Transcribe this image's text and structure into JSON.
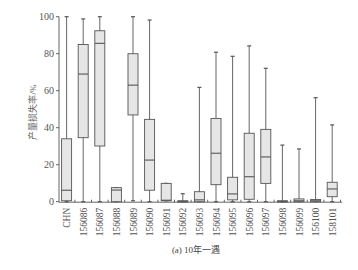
{
  "chart_data": {
    "type": "boxplot",
    "title": "(a) 10年一遇",
    "xlabel": "",
    "ylabel": "产量损失率/%",
    "ylim": [
      0,
      100
    ],
    "yticks": [
      0,
      20,
      40,
      60,
      80,
      100
    ],
    "grid": false,
    "legend": null,
    "categories": [
      "CHN",
      "156086",
      "156087",
      "156088",
      "156089",
      "156090",
      "156091",
      "156092",
      "156093",
      "156094",
      "156095",
      "156096",
      "156097",
      "156098",
      "156099",
      "156100",
      "158101"
    ],
    "boxes": [
      {
        "name": "CHN",
        "whisker_low": 0,
        "q1": 0.5,
        "median": 6.2,
        "q3": 34,
        "whisker_high": 100
      },
      {
        "name": "156086",
        "whisker_low": 0,
        "q1": 34.6,
        "median": 69,
        "q3": 85,
        "whisker_high": 98.8
      },
      {
        "name": "156087",
        "whisker_low": 0,
        "q1": 30.1,
        "median": 85.6,
        "q3": 92.4,
        "whisker_high": 100
      },
      {
        "name": "156088",
        "whisker_low": 0,
        "q1": 0,
        "median": 6.3,
        "q3": 7.6,
        "whisker_high": 7.6
      },
      {
        "name": "156089",
        "whisker_low": 0.5,
        "q1": 46.9,
        "median": 63,
        "q3": 80,
        "whisker_high": 100
      },
      {
        "name": "156090",
        "whisker_low": 0,
        "q1": 6.2,
        "median": 22.5,
        "q3": 44.5,
        "whisker_high": 98.2
      },
      {
        "name": "156091",
        "whisker_low": 0.5,
        "q1": 0.5,
        "median": 0.8,
        "q3": 9.9,
        "whisker_high": 9.9
      },
      {
        "name": "156092",
        "whisker_low": 0,
        "q1": 0,
        "median": 0.2,
        "q3": 0.5,
        "whisker_high": 4.3
      },
      {
        "name": "156093",
        "whisker_low": 0,
        "q1": 0,
        "median": 1,
        "q3": 5.4,
        "whisker_high": 61.8
      },
      {
        "name": "156094",
        "whisker_low": 0,
        "q1": 9.2,
        "median": 26.2,
        "q3": 45,
        "whisker_high": 80.8
      },
      {
        "name": "156095",
        "whisker_low": 0,
        "q1": 1,
        "median": 4.2,
        "q3": 13.2,
        "whisker_high": 78.6
      },
      {
        "name": "156096",
        "whisker_low": 0,
        "q1": 1.3,
        "median": 13.5,
        "q3": 37,
        "whisker_high": 84.2
      },
      {
        "name": "156097",
        "whisker_low": 0,
        "q1": 9.9,
        "median": 24.2,
        "q3": 39.1,
        "whisker_high": 72.1
      },
      {
        "name": "156098",
        "whisker_low": 0,
        "q1": 0,
        "median": 0.2,
        "q3": 0.5,
        "whisker_high": 30.6
      },
      {
        "name": "156099",
        "whisker_low": 0,
        "q1": 0,
        "median": 0.5,
        "q3": 1.5,
        "whisker_high": 28.5
      },
      {
        "name": "156100",
        "whisker_low": 0,
        "q1": 0,
        "median": 0.5,
        "q3": 1.2,
        "whisker_high": 56.2
      },
      {
        "name": "158101",
        "whisker_low": 0,
        "q1": 2.7,
        "median": 6.9,
        "q3": 10.5,
        "whisker_high": 41.5
      }
    ],
    "colors": {
      "box_fill": "#e6e6e6",
      "stroke": "#555555",
      "axis": "#666666"
    }
  }
}
